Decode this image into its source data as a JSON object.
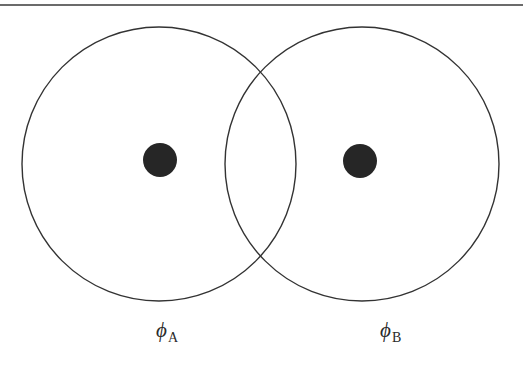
{
  "diagram": {
    "type": "overlapping-orbitals",
    "colors": {
      "stroke": "#333333",
      "nucleus": "#262626",
      "background": "#ffffff",
      "rule": "#3a3a3a"
    },
    "top_rule": {
      "y": 5,
      "x1": 0,
      "x2": 523
    },
    "orbitals": [
      {
        "id": "A",
        "cx": 159,
        "cy": 164,
        "r": 137,
        "nucleus": {
          "cx": 160,
          "cy": 160,
          "r": 17
        },
        "label": {
          "symbol": "ϕ",
          "subscript": "A",
          "x": 156,
          "y": 320
        }
      },
      {
        "id": "B",
        "cx": 362,
        "cy": 164,
        "r": 137,
        "nucleus": {
          "cx": 360,
          "cy": 161,
          "r": 17
        },
        "label": {
          "symbol": "ϕ",
          "subscript": "B",
          "x": 380,
          "y": 320
        }
      }
    ]
  }
}
